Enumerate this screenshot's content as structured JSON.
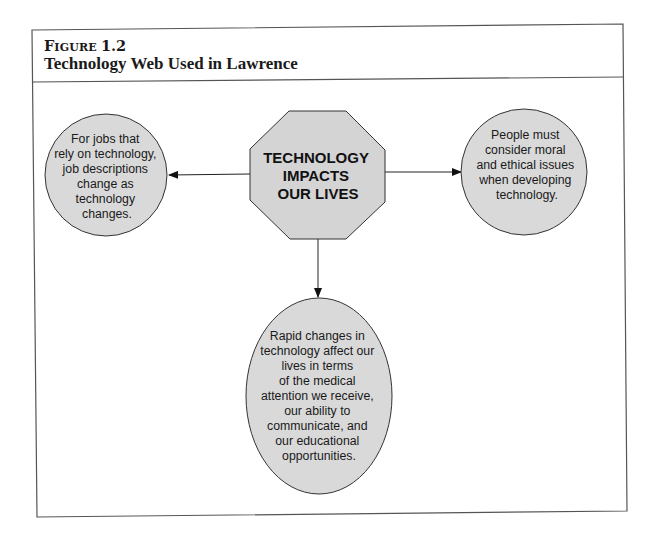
{
  "figure": {
    "label_prefix_cap": "F",
    "label_prefix_small": "IGURE",
    "label_number": "1.2",
    "title": "Technology Web Used in Lawrence"
  },
  "diagram": {
    "center": {
      "lines": [
        "TECHNOLOGY",
        "IMPACTS",
        "OUR LIVES"
      ],
      "shape": "octagon"
    },
    "nodes": {
      "left": {
        "lines": [
          "For jobs that",
          "rely on technology,",
          "job descriptions",
          "change as",
          "technology",
          "changes."
        ],
        "shape": "circle"
      },
      "right": {
        "lines": [
          "People must",
          "consider moral",
          "and ethical issues",
          "when developing",
          "technology."
        ],
        "shape": "circle"
      },
      "bottom": {
        "lines": [
          "Rapid changes in",
          "technology affect our",
          "lives in terms",
          "of the medical",
          "attention we receive,",
          "our ability to",
          "communicate, and",
          "our educational",
          "opportunities."
        ],
        "shape": "ellipse"
      }
    },
    "edges": [
      {
        "from": "center",
        "to": "left"
      },
      {
        "from": "center",
        "to": "right"
      },
      {
        "from": "center",
        "to": "bottom"
      }
    ],
    "colors": {
      "shape_fill": "#d9d9d9",
      "shape_stroke": "#333333",
      "frame_stroke": "#555555"
    }
  }
}
